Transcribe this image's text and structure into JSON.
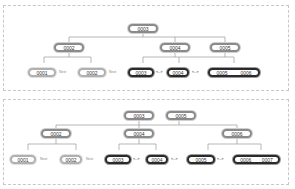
{
  "diagram": {
    "panels": [
      {
        "name": "before-split",
        "root": {
          "keys": [
            "0003"
          ]
        },
        "internal": [
          {
            "keys": [
              "0002"
            ]
          },
          {
            "keys": [
              "0004"
            ]
          },
          {
            "keys": [
              "0005"
            ]
          }
        ],
        "leaves": [
          {
            "keys": [
              "0001"
            ],
            "style": "old"
          },
          {
            "keys": [
              "0002"
            ],
            "style": "old"
          },
          {
            "keys": [
              "0003"
            ],
            "style": "new"
          },
          {
            "keys": [
              "0004"
            ],
            "style": "new"
          },
          {
            "keys": [
              "0005",
              "0006"
            ],
            "style": "new"
          }
        ],
        "edge_labels": [
          "Next",
          "Next",
          "<-->",
          "<-->"
        ]
      },
      {
        "name": "after-split",
        "root": {
          "keys": [
            "0003",
            "0005"
          ]
        },
        "internal": [
          {
            "keys": [
              "0002"
            ]
          },
          {
            "keys": [
              "0004"
            ]
          },
          {
            "keys": [
              "0006"
            ]
          }
        ],
        "leaves": [
          {
            "keys": [
              "0001"
            ],
            "style": "old"
          },
          {
            "keys": [
              "0002"
            ],
            "style": "old"
          },
          {
            "keys": [
              "0003"
            ],
            "style": "new"
          },
          {
            "keys": [
              "0004"
            ],
            "style": "new"
          },
          {
            "keys": [
              "0005"
            ],
            "style": "new"
          },
          {
            "keys": [
              "0006",
              "0007"
            ],
            "style": "new"
          }
        ],
        "edge_labels": [
          "Next",
          "Next",
          "<-->",
          "<-->",
          "<-->"
        ]
      }
    ]
  }
}
